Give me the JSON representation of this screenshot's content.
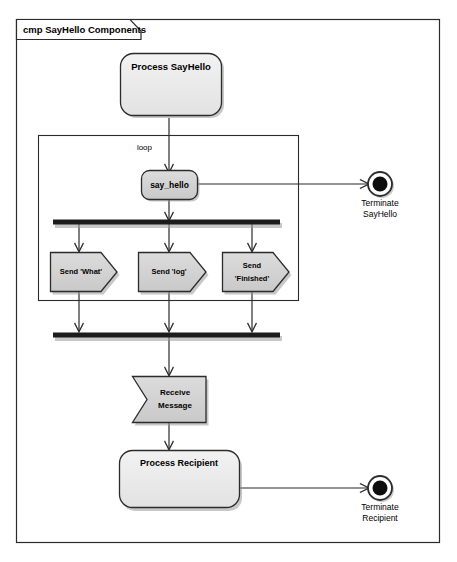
{
  "diagram": {
    "frame_title": "cmp SayHello Components",
    "kind": "uml-component-activity-diagram",
    "colors": {
      "canvas": "#ffffff",
      "node_fill": "#d4d4d4",
      "node_fill_light": "#ececec",
      "stroke": "#3a3a3a",
      "bar": "#1c1c1c",
      "shadow": "#9a9a9a"
    },
    "nodes": {
      "process_sayhello": {
        "label": "Process SayHello"
      },
      "loop_frame": {
        "label": "loop"
      },
      "say_hello": {
        "label": "say_hello"
      },
      "terminate_sayhello": {
        "label_line1": "Terminate",
        "label_line2": "SayHello"
      },
      "send_what": {
        "label": "Send 'What'"
      },
      "send_log": {
        "label": "Send 'log'"
      },
      "send_finished": {
        "label_line1": "Send",
        "label_line2": "'Finished'"
      },
      "receive_message": {
        "label_line1": "Receive",
        "label_line2": "Message"
      },
      "process_recipient": {
        "label": "Process Recipient"
      },
      "terminate_recipient": {
        "label_line1": "Terminate",
        "label_line2": "Recipient"
      }
    }
  }
}
